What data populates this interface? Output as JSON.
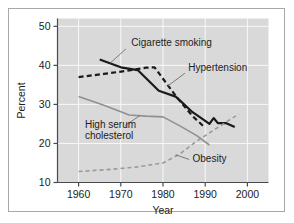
{
  "chart_data": {
    "type": "line",
    "title": "",
    "subtitle": "",
    "xlabel": "Year",
    "ylabel": "Percent",
    "xlim": [
      1955,
      2005
    ],
    "ylim": [
      10,
      52
    ],
    "xticks": [
      1960,
      1970,
      1980,
      1990,
      2000
    ],
    "xtick_labels": [
      "1960",
      "1970",
      "1980",
      "1990",
      "2000"
    ],
    "yticks": [
      10,
      20,
      30,
      40,
      50
    ],
    "ytick_labels": [
      "10",
      "20",
      "30",
      "40",
      "50"
    ],
    "grid": true,
    "grid_color": "#ffffff",
    "plot_background": "#d9d9d9",
    "legend_position": "inline-annotations",
    "series": [
      {
        "name": "Cigarette smoking",
        "style": "solid",
        "color": "#1a1a1a",
        "width": 2.2,
        "x": [
          1965,
          1970,
          1974,
          1979,
          1983,
          1985,
          1987,
          1990,
          1991,
          1992,
          1993,
          1995,
          1997
        ],
        "values": [
          41.5,
          39.5,
          38.8,
          33.5,
          32.0,
          30.0,
          28.0,
          25.8,
          25.0,
          26.5,
          25.2,
          25.2,
          24.2
        ]
      },
      {
        "name": "Hypertension",
        "style": "dashed",
        "color": "#1a1a1a",
        "width": 2.2,
        "x": [
          1960,
          1966,
          1972,
          1976,
          1978,
          1983,
          1987,
          1990
        ],
        "values": [
          37.0,
          37.8,
          38.7,
          39.4,
          39.5,
          32.2,
          27.0,
          24.0
        ]
      },
      {
        "name": "High serum cholesterol",
        "style": "solid",
        "color": "#909090",
        "width": 1.6,
        "x": [
          1960,
          1966,
          1972,
          1976,
          1980,
          1984,
          1988,
          1991
        ],
        "values": [
          32.0,
          29.8,
          27.3,
          27.0,
          26.8,
          24.5,
          22.0,
          19.6
        ]
      },
      {
        "name": "Obesity",
        "style": "dashed",
        "color": "#9a9a9a",
        "width": 1.6,
        "x": [
          1960,
          1968,
          1974,
          1980,
          1984,
          1988,
          1992,
          1996,
          1998
        ],
        "values": [
          12.8,
          13.4,
          14.0,
          15.0,
          17.3,
          20.6,
          23.4,
          26.2,
          27.5
        ]
      }
    ],
    "annotations": [
      {
        "name": "cigarette-smoking",
        "text": "Cigarette smoking",
        "lines": [
          "Cigarette smoking"
        ],
        "text_x": 1972.5,
        "text_y": 45.0,
        "leader_from": [
          1971.2,
          44.2
        ],
        "leader_to": [
          1967.5,
          40.6
        ]
      },
      {
        "name": "hypertension",
        "text": "Hypertension",
        "lines": [
          "Hypertension"
        ],
        "text_x": 1986.0,
        "text_y": 38.6,
        "leader_from": [
          1985.2,
          38.0
        ],
        "leader_to": [
          1981.0,
          34.6
        ]
      },
      {
        "name": "high-serum-cholesterol",
        "text": "High serum cholesterol",
        "lines": [
          "High serum",
          "cholesterol"
        ],
        "text_x": 1961.5,
        "text_y": 24.0,
        "leader_from": [
          1971.0,
          24.6
        ],
        "leader_to": [
          1974.5,
          27.1
        ]
      },
      {
        "name": "obesity",
        "text": "Obesity",
        "lines": [
          "Obesity"
        ],
        "text_x": 1987.0,
        "text_y": 15.2,
        "leader_from": [
          1986.2,
          15.9
        ],
        "leader_to": [
          1983.0,
          17.1
        ]
      }
    ]
  }
}
